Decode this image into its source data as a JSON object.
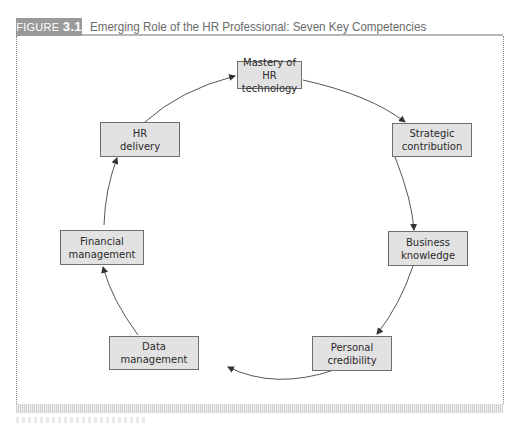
{
  "header": {
    "figure_word": "FIGURE",
    "figure_number": "3.1",
    "title": "Emerging Role of the HR Professional: Seven Key Competencies"
  },
  "diagram": {
    "type": "cycle",
    "direction": "clockwise",
    "nodes": [
      {
        "id": "mastery",
        "line1": "Mastery of",
        "line2": "HR technology"
      },
      {
        "id": "strategic",
        "line1": "Strategic",
        "line2": "contribution"
      },
      {
        "id": "business",
        "line1": "Business",
        "line2": "knowledge"
      },
      {
        "id": "personal",
        "line1": "Personal",
        "line2": "credibility"
      },
      {
        "id": "data",
        "line1": "Data",
        "line2": "management"
      },
      {
        "id": "financial",
        "line1": "Financial",
        "line2": "management"
      },
      {
        "id": "delivery",
        "line1": "HR",
        "line2": "delivery"
      }
    ],
    "edges": [
      [
        "mastery",
        "strategic"
      ],
      [
        "strategic",
        "business"
      ],
      [
        "business",
        "personal"
      ],
      [
        "personal",
        "data"
      ],
      [
        "data",
        "financial"
      ],
      [
        "financial",
        "delivery"
      ],
      [
        "delivery",
        "mastery"
      ]
    ]
  },
  "colors": {
    "node_fill": "#e2e2e2",
    "node_border": "#6e6e6e",
    "label_bg": "#9a9a9a",
    "title_text": "#6a6a6a"
  }
}
